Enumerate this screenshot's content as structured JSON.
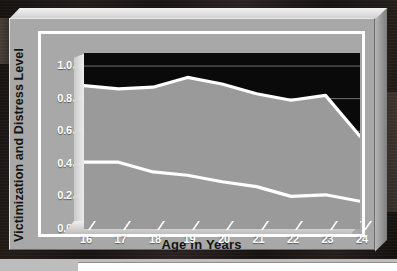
{
  "chart_data": {
    "type": "area",
    "title": "",
    "xlabel": "Age in Years",
    "ylabel": "Victimization and Distress Level",
    "categories": [
      16,
      17,
      18,
      19,
      20,
      21,
      22,
      23,
      24
    ],
    "x_tick_labels": [
      "16",
      "17",
      "18",
      "19",
      "20",
      "21",
      "22",
      "23",
      "24"
    ],
    "y_tick_labels": [
      "0.0",
      "0.2",
      "0.4",
      "0.6",
      "0.8",
      "1.0"
    ],
    "y_tick_values": [
      0.0,
      0.2,
      0.4,
      0.6,
      0.8,
      1.0
    ],
    "xlim": [
      16,
      24
    ],
    "ylim": [
      0.0,
      1.08
    ],
    "grid": true,
    "grid_axis": "y",
    "legend": "none",
    "series": [
      {
        "name": "upper-band",
        "values": [
          0.88,
          0.86,
          0.87,
          0.93,
          0.89,
          0.83,
          0.79,
          0.82,
          0.57
        ]
      },
      {
        "name": "lower-band",
        "values": [
          0.41,
          0.41,
          0.35,
          0.33,
          0.29,
          0.26,
          0.2,
          0.21,
          0.17
        ]
      }
    ],
    "colors": {
      "plot_background": "#0a0a0a",
      "band_fill": "#9a9a9a",
      "line": "#ffffff",
      "panel": "#a8a8a8",
      "text": "#141414",
      "tick_text": "#ffffff",
      "gridline": "#6f6f6f"
    }
  }
}
